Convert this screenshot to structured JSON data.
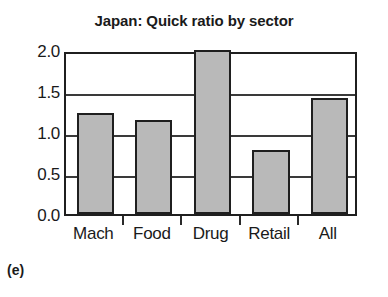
{
  "caption": "(e)",
  "chart_data": {
    "type": "bar",
    "title": "Japan: Quick ratio by sector",
    "xlabel": "",
    "ylabel": "",
    "categories": [
      "Mach",
      "Food",
      "Drug",
      "Retail",
      "All"
    ],
    "values": [
      1.23,
      1.15,
      2.0,
      0.78,
      1.42
    ],
    "ylim": [
      0.0,
      2.0
    ],
    "yticks": [
      0.0,
      0.5,
      1.0,
      1.5,
      2.0
    ],
    "ytick_labels": [
      "0.0",
      "0.5",
      "1.0",
      "1.5",
      "2.0"
    ],
    "grid": true,
    "legend": false,
    "bar_fill_color": "#b9b9b9",
    "bar_edge_color": "#1f1f1f",
    "axis_color": "#1f1f1f",
    "text_color": "#1a1a1a",
    "background_color": "#ffffff"
  }
}
